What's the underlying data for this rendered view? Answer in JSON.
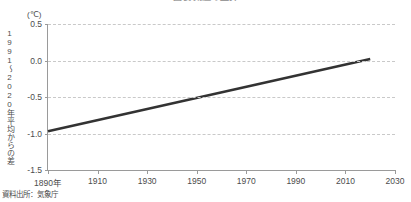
{
  "figure": {
    "title_fragment": "図表  気温の上昇",
    "source_note": "資料出所：気象庁"
  },
  "chart_data": {
    "type": "line",
    "title": "図表  気温の上昇",
    "xlabel": "",
    "ylabel": "1991〜2020年平均からの差",
    "yunit": "(℃)",
    "xlim": [
      1890,
      2030
    ],
    "ylim": [
      -1.5,
      0.5
    ],
    "grid": true,
    "legend": "none",
    "xticks": [
      1890,
      1910,
      1930,
      1950,
      1970,
      1990,
      2010,
      2030
    ],
    "xticklabels": [
      "1890年",
      "1910",
      "1930",
      "1950",
      "1970",
      "1990",
      "2010",
      "2030"
    ],
    "yticks": [
      0.5,
      0.0,
      -0.5,
      -1.0,
      -1.5
    ],
    "yticklabels": [
      "0.5",
      "0.0",
      "-0.5",
      "-1.0",
      "-1.5"
    ],
    "series": [
      {
        "name": "年平均気温偏差の長期変化傾向",
        "color": "#333333",
        "x": [
          1890,
          2020
        ],
        "values": [
          -0.97,
          0.02
        ]
      }
    ]
  }
}
